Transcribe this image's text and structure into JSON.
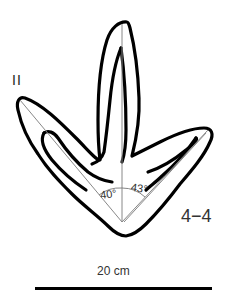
{
  "figure": {
    "toe_label": "II",
    "specimen_label": "4−4",
    "angles": {
      "left": "40°",
      "right": "43°"
    },
    "interdigital_angles_deg": [
      40,
      43
    ],
    "scale": {
      "label": "20 cm",
      "length_cm": 20
    },
    "colors": {
      "outline": "#000000",
      "axis_lines": "#888888",
      "background": "#ffffff"
    }
  }
}
